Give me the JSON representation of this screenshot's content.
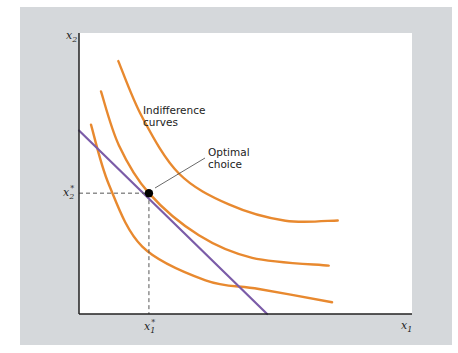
{
  "chart_data": {
    "type": "line",
    "title": "",
    "xlabel": "x1",
    "ylabel": "x2",
    "colors": {
      "indifference_curve": "#e8892f",
      "budget_line": "#7b5ca8",
      "panel_background": "#d5d8db",
      "plot_background": "#ffffff",
      "axis": "#222222",
      "guide": "#555555"
    },
    "axes": {
      "x_label": {
        "main": "x",
        "sub": "1"
      },
      "y_label": {
        "main": "x",
        "sub": "2"
      },
      "xlim": [
        0,
        10
      ],
      "ylim": [
        0,
        10
      ]
    },
    "series": [
      {
        "name": "indifference-curve-low",
        "kind": "indifference",
        "points": [
          [
            0.36,
            6.74
          ],
          [
            0.9,
            4.6
          ],
          [
            1.9,
            2.4
          ],
          [
            3.8,
            1.2
          ],
          [
            5.4,
            0.89
          ],
          [
            7.6,
            0.42
          ]
        ]
      },
      {
        "name": "indifference-curve-optimal",
        "kind": "indifference",
        "points": [
          [
            0.66,
            7.92
          ],
          [
            1.2,
            6.0
          ],
          [
            2.1,
            4.3
          ],
          [
            3.6,
            2.8
          ],
          [
            5.2,
            2.0
          ],
          [
            7.5,
            1.72
          ]
        ]
      },
      {
        "name": "indifference-curve-high",
        "kind": "indifference",
        "points": [
          [
            1.18,
            9.0
          ],
          [
            1.9,
            7.0
          ],
          [
            3.0,
            5.0
          ],
          [
            4.5,
            3.9
          ],
          [
            6.2,
            3.32
          ],
          [
            7.77,
            3.33
          ]
        ]
      },
      {
        "name": "budget-line",
        "kind": "budget",
        "points": [
          [
            0,
            6.53
          ],
          [
            5.65,
            0
          ]
        ]
      }
    ],
    "optimal_point": {
      "x": 2.1,
      "y": 4.3,
      "x_label": {
        "main": "x",
        "sub": "1",
        "sup": "*"
      },
      "y_label": {
        "main": "x",
        "sub": "2",
        "sup": "*"
      }
    },
    "annotations": [
      {
        "id": "indifference",
        "lines": [
          "Indifference",
          "curves"
        ]
      },
      {
        "id": "optimal",
        "lines": [
          "Optimal",
          "choice"
        ]
      }
    ]
  }
}
